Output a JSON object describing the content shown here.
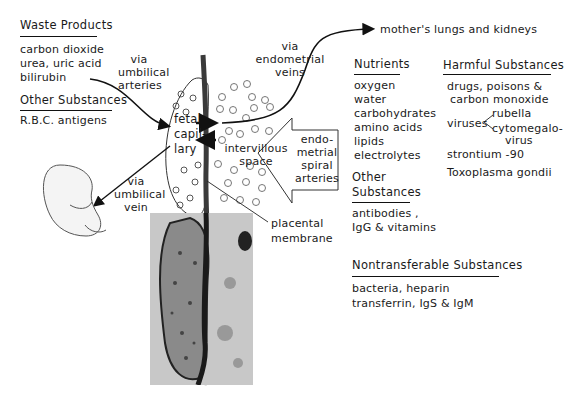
{
  "waste_products": {
    "heading": "Waste Products",
    "items": [
      "carbon dioxide",
      "urea, uric acid",
      "bilirubin"
    ]
  },
  "other_substances_left": {
    "heading": "Other Substances",
    "items": [
      "R.B.C. antigens"
    ]
  },
  "labels": {
    "via_umbilical_arteries": [
      "via",
      "umbilical",
      "arteries"
    ],
    "via_umbilical_vein": [
      "via",
      "umbilical",
      "vein"
    ],
    "via_endometrial_veins": [
      "via",
      "endometrial",
      "veins"
    ],
    "fetal_capillary": [
      "fetal",
      "capil-",
      "lary"
    ],
    "intervillous_space": [
      "intervillous",
      "space"
    ],
    "endometrial_spiral_arteries": [
      "endo-",
      "metrial",
      "spiral",
      "arteries"
    ],
    "placental_membrane": [
      "placental",
      "membrane"
    ],
    "destination": "mother's lungs and kidneys"
  },
  "nutrients": {
    "heading": "Nutrients",
    "items": [
      "oxygen",
      "water",
      "carbohydrates",
      "amino acids",
      "lipids",
      "electrolytes"
    ]
  },
  "other_substances_right": {
    "heading_line1": "Other",
    "heading_line2": "Substances",
    "items": [
      "antibodies ,",
      "IgG & vitamins"
    ]
  },
  "harmful_substances": {
    "heading": "Harmful Substances",
    "drugs_line1": "drugs, poisons &",
    "drugs_line2": "carbon monoxide",
    "viruses_label": "viruses",
    "viruses": [
      "rubella",
      "cytomegalo-",
      "virus"
    ],
    "others": [
      "strontium -90",
      "Toxoplasma gondii"
    ]
  },
  "nontransferable": {
    "heading": "Nontransferable Substances",
    "items": [
      "bacteria, heparin",
      "transferrin, IgS & IgM"
    ]
  },
  "colors": {
    "ink": "#1a1a1a",
    "micrograph": "#b9b9b9",
    "membrane": "#3a3a3a"
  }
}
